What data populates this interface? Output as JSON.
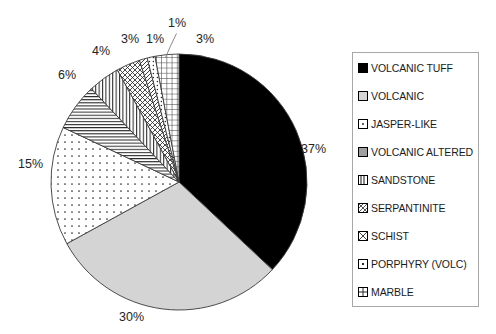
{
  "chart_data": {
    "type": "pie",
    "title": "",
    "subtitle": "",
    "xlabel": "",
    "ylabel": "",
    "grid": false,
    "legend_position": "right",
    "categories": [
      "VOLCANIC TUFF",
      "VOLCANIC",
      "JASPER-LIKE",
      "VOLCANIC ALTERED",
      "SANDSTONE",
      "SERPANTINITE",
      "SCHIST",
      "PORPHYRY (VOLC)",
      "MARBLE"
    ],
    "values": [
      37,
      30,
      15,
      6,
      4,
      3,
      1,
      1,
      3
    ],
    "value_labels": [
      "37%",
      "30%",
      "15%",
      "6%",
      "4%",
      "3%",
      "1%",
      "1%",
      "3%"
    ],
    "units": "percent",
    "start_angle_deg": 0,
    "direction": "clockwise",
    "slices": [
      {
        "label": "VOLCANIC TUFF",
        "value": 37,
        "display": "37%",
        "fill": "solid-black",
        "color": "#000000"
      },
      {
        "label": "VOLCANIC",
        "value": 30,
        "display": "30%",
        "fill": "solid-lightgray",
        "color": "#d4d4d4"
      },
      {
        "label": "JASPER-LIKE",
        "value": 15,
        "display": "15%",
        "fill": "dots-sparse",
        "color": "#ffffff"
      },
      {
        "label": "VOLCANIC ALTERED",
        "value": 6,
        "display": "6%",
        "fill": "lines-horizontal",
        "color": "#ffffff"
      },
      {
        "label": "SANDSTONE",
        "value": 4,
        "display": "4%",
        "fill": "lines-vertical",
        "color": "#ffffff"
      },
      {
        "label": "SERPANTINITE",
        "value": 3,
        "display": "3%",
        "fill": "cross-diagonal",
        "color": "#ffffff"
      },
      {
        "label": "SCHIST",
        "value": 1,
        "display": "1%",
        "fill": "lines-diagonal",
        "color": "#ffffff"
      },
      {
        "label": "PORPHYRY (VOLC)",
        "value": 1,
        "display": "1%",
        "fill": "dots-fine",
        "color": "#ffffff"
      },
      {
        "label": "MARBLE",
        "value": 3,
        "display": "3%",
        "fill": "grid-cross",
        "color": "#ffffff"
      }
    ]
  },
  "legend": {
    "items": [
      {
        "label": "VOLCANIC TUFF",
        "swatch": "swatch-solid-black"
      },
      {
        "label": "VOLCANIC",
        "swatch": "swatch-solid-lightgray"
      },
      {
        "label": "JASPER-LIKE",
        "swatch": "swatch-dots-sparse"
      },
      {
        "label": "VOLCANIC ALTERED",
        "swatch": "swatch-lines-horizontal"
      },
      {
        "label": "SANDSTONE",
        "swatch": "swatch-lines-vertical"
      },
      {
        "label": "SERPANTINITE",
        "swatch": "swatch-cross-diagonal"
      },
      {
        "label": "SCHIST",
        "swatch": "swatch-lines-diagonal"
      },
      {
        "label": "PORPHYRY (VOLC)",
        "swatch": "swatch-dots-fine"
      },
      {
        "label": "MARBLE",
        "swatch": "swatch-grid-cross"
      }
    ]
  },
  "labels": {
    "p37": "37%",
    "p30": "30%",
    "p15": "15%",
    "p6": "6%",
    "p4": "4%",
    "p3a": "3%",
    "p1a": "1%",
    "p1b": "1%",
    "p3b": "3%"
  },
  "colors": {
    "slice_black": "#000000",
    "slice_lightgray": "#d4d4d4",
    "outline": "#3a3a3a",
    "legend_border": "#a8a8a8",
    "text": "#232323",
    "background": "#ffffff"
  }
}
